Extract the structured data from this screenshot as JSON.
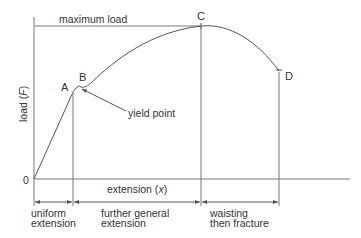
{
  "diagram": {
    "type": "load-extension curve",
    "axes": {
      "ylabel": "load (F)",
      "ylabel_text": "load (",
      "ylabel_var": "F",
      "ylabel_close": ")",
      "xlabel_text": "extension (",
      "xlabel_var": "x",
      "xlabel_close": ")",
      "origin": "0"
    },
    "annotations": {
      "max_load": "maximum load",
      "yield_point": "yield point"
    },
    "points": {
      "A": "A",
      "B": "B",
      "C": "C",
      "D": "D"
    },
    "regions": [
      {
        "line1": "uniform",
        "line2": "extension"
      },
      {
        "line1": "further general",
        "line2": "extension"
      },
      {
        "line1": "waisting",
        "line2": "then fracture"
      }
    ],
    "colors": {
      "line": "#555555",
      "text": "#333333",
      "background": "#ffffff"
    }
  }
}
